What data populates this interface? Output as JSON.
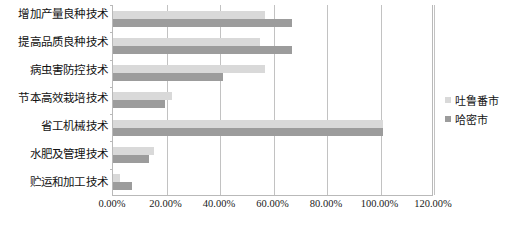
{
  "chart_data": {
    "type": "bar",
    "orientation": "horizontal",
    "title": "",
    "subtitle": "",
    "xlabel": "",
    "ylabel": "",
    "xlim": [
      0,
      120
    ],
    "xtick_labels": [
      "0.00%",
      "20.00%",
      "40.00%",
      "60.00%",
      "80.00%",
      "100.00%",
      "120.00%"
    ],
    "xtick_values": [
      0,
      20,
      40,
      60,
      80,
      100,
      120
    ],
    "grid": "vertical",
    "legend_position": "right",
    "categories": [
      "增加产量良种技术",
      "提高品质良种技术",
      "病虫害防控技术",
      "节本高效栽培技术",
      "省工机械技术",
      "水肥及管理技术",
      "贮运和加工技术"
    ],
    "series": [
      {
        "name": "吐鲁番市",
        "color": "#d9d9d9",
        "values": [
          57,
          55,
          57,
          22,
          101,
          15.5,
          2.5
        ]
      },
      {
        "name": "哈密市",
        "color": "#9c9c9c",
        "values": [
          67,
          67,
          41,
          19.5,
          101,
          13.5,
          7
        ]
      }
    ]
  },
  "legend": {
    "items": [
      {
        "label": "吐鲁番市"
      },
      {
        "label": "哈密市"
      }
    ]
  }
}
